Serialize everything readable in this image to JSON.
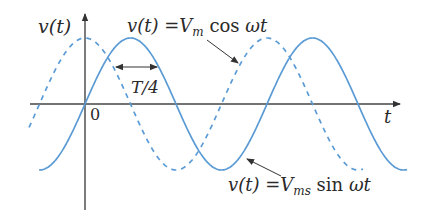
{
  "diagram": {
    "type": "waveform",
    "title": "",
    "axes": {
      "y_label": "v(t)",
      "x_label": "t",
      "origin_label": "0"
    },
    "curves": [
      {
        "name": "cosine",
        "style": "dashed",
        "equation": {
          "lhs": "v(t)",
          "eq": "=",
          "coef": "V",
          "sub": "m",
          "fn": "cos",
          "arg": "ωt"
        }
      },
      {
        "name": "sine",
        "style": "solid",
        "equation": {
          "lhs": "v(t)",
          "eq": "=",
          "coef": "V",
          "sub": "ms",
          "fn": "sin",
          "arg": "ωt"
        }
      }
    ],
    "annotations": {
      "phase_shift_label": "T/4"
    },
    "colors": {
      "curve": "#5b9bd5",
      "axis": "#444444",
      "text": "#2a2a2a"
    }
  }
}
